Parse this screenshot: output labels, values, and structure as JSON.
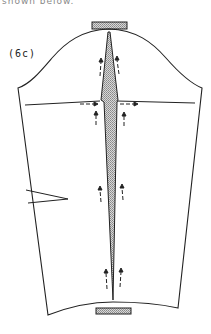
{
  "figure": {
    "cropped_caption": "shown below.",
    "label": "(6c)",
    "colors": {
      "line": "#222222",
      "fill_shaded": "#c8c8c8",
      "background": "#ffffff"
    }
  }
}
